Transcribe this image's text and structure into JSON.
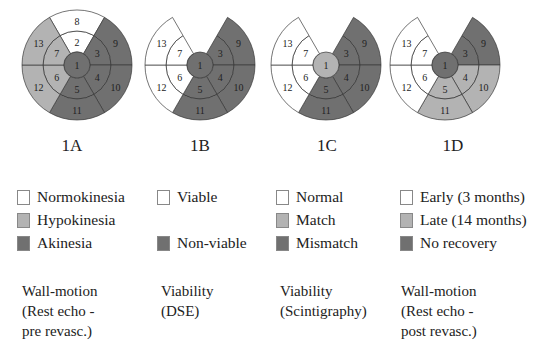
{
  "colors": {
    "white": "#ffffff",
    "light": "#b3b3b3",
    "dark": "#707070",
    "stroke": "#3a3a3a"
  },
  "diagrams": [
    {
      "id": "1A",
      "label": "1A",
      "cx": 77,
      "cy": 65,
      "has_top": true,
      "segments": {
        "1": "dark",
        "2": "white",
        "3": "dark",
        "4": "dark",
        "5": "dark",
        "6": "light",
        "7": "light",
        "8": "white",
        "9": "dark",
        "10": "dark",
        "11": "dark",
        "12": "light",
        "13": "light"
      }
    },
    {
      "id": "1B",
      "label": "1B",
      "cx": 200,
      "cy": 65,
      "has_top": false,
      "segments": {
        "1": "dark",
        "3": "dark",
        "4": "dark",
        "5": "dark",
        "6": "white",
        "7": "white",
        "9": "dark",
        "10": "dark",
        "11": "dark",
        "12": "white",
        "13": "white"
      }
    },
    {
      "id": "1C",
      "label": "1C",
      "cx": 326,
      "cy": 65,
      "has_top": false,
      "segments": {
        "1": "light",
        "3": "dark",
        "4": "dark",
        "5": "dark",
        "6": "white",
        "7": "white",
        "9": "dark",
        "10": "dark",
        "11": "dark",
        "12": "white",
        "13": "white"
      }
    },
    {
      "id": "1D",
      "label": "1D",
      "cx": 445,
      "cy": 65,
      "has_top": false,
      "segments": {
        "1": "dark",
        "3": "dark",
        "4": "light",
        "5": "light",
        "6": "white",
        "7": "white",
        "9": "dark",
        "10": "light",
        "11": "light",
        "12": "white",
        "13": "white"
      }
    }
  ],
  "legends": [
    {
      "items": [
        {
          "label": "Normokinesia",
          "color": "white",
          "row": 0
        },
        {
          "label": "Hypokinesia",
          "color": "light",
          "row": 1
        },
        {
          "label": "Akinesia",
          "color": "dark",
          "row": 2
        }
      ],
      "caption": "Wall-motion\n(Rest echo -\npre revasc.)"
    },
    {
      "items": [
        {
          "label": "Viable",
          "color": "white",
          "row": 0
        },
        {
          "label": "Non-viable",
          "color": "dark",
          "row": 2
        }
      ],
      "caption": "Viability\n(DSE)"
    },
    {
      "items": [
        {
          "label": "Normal",
          "color": "white",
          "row": 0
        },
        {
          "label": "Match",
          "color": "light",
          "row": 1
        },
        {
          "label": "Mismatch",
          "color": "dark",
          "row": 2
        }
      ],
      "caption": "Viability\n(Scintigraphy)"
    },
    {
      "items": [
        {
          "label": "Early (3 months)",
          "color": "white",
          "row": 0
        },
        {
          "label": "Late (14 months)",
          "color": "light",
          "row": 1
        },
        {
          "label": "No recovery",
          "color": "dark",
          "row": 2
        }
      ],
      "caption": "Wall-motion\n(Rest echo -\npost revasc.)"
    }
  ],
  "geometry": {
    "r_center": 13,
    "r_mid": 34,
    "r_outer": 55,
    "sectors": [
      {
        "mid": "2",
        "outer": "8",
        "a0": -120,
        "a1": -60
      },
      {
        "mid": "3",
        "outer": "9",
        "a0": -60,
        "a1": 0
      },
      {
        "mid": "4",
        "outer": "10",
        "a0": 0,
        "a1": 60
      },
      {
        "mid": "5",
        "outer": "11",
        "a0": 60,
        "a1": 120
      },
      {
        "mid": "6",
        "outer": "12",
        "a0": 120,
        "a1": 180
      },
      {
        "mid": "7",
        "outer": "13",
        "a0": 180,
        "a1": 240
      }
    ]
  }
}
